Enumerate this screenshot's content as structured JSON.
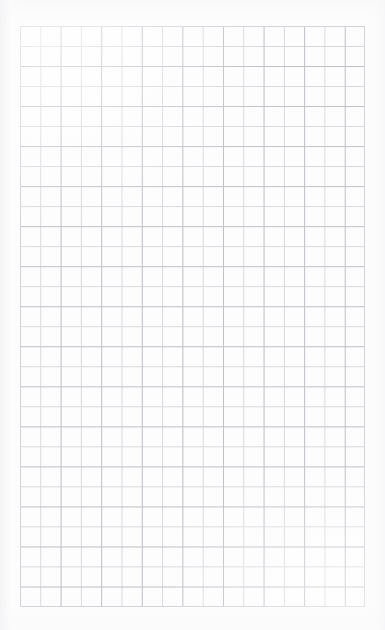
{
  "page": {
    "kind": "graph-paper-sheet",
    "width": 385,
    "height": 630,
    "background_color": "#fdfdfd",
    "paper_edge_tint": "#f3f3f5"
  },
  "grid": {
    "label": "Ruled square grid",
    "left": 20,
    "top": 26,
    "right": 365,
    "bottom": 607,
    "width": 345,
    "height": 581,
    "columns": 17,
    "rows": 29,
    "cell_width": 20.3,
    "cell_height": 20.03,
    "line_color": "#d8d8dc",
    "line_color_accent": "#c9c9ce",
    "line_width": 1,
    "border_color": "#d2d2d7"
  },
  "content": {
    "text": "",
    "annotations": []
  }
}
